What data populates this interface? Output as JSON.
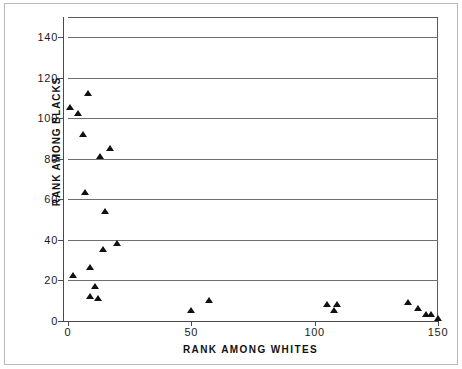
{
  "chart_data": {
    "type": "scatter",
    "title": "",
    "xlabel": "RANK AMONG WHITES",
    "ylabel": "RANK AMONG BLACKS",
    "xlim": [
      0,
      150
    ],
    "ylim": [
      0,
      150
    ],
    "xticks": [
      0,
      50,
      100,
      150
    ],
    "yticks": [
      0,
      20,
      40,
      60,
      80,
      100,
      120,
      140
    ],
    "xtick_labels": [
      "0",
      "50",
      "100",
      "150"
    ],
    "ytick_labels": [
      "0",
      "20",
      "40",
      "60",
      "80",
      "100",
      "120",
      "140"
    ],
    "grid": "horizontal",
    "legend": null,
    "marker": "triangle",
    "marker_color": "#111111",
    "points": [
      {
        "x": 1,
        "y": 105
      },
      {
        "x": 4,
        "y": 102
      },
      {
        "x": 8,
        "y": 112
      },
      {
        "x": 6,
        "y": 92
      },
      {
        "x": 13,
        "y": 81
      },
      {
        "x": 17,
        "y": 85
      },
      {
        "x": 7,
        "y": 63
      },
      {
        "x": 15,
        "y": 54
      },
      {
        "x": 14,
        "y": 35
      },
      {
        "x": 20,
        "y": 38
      },
      {
        "x": 2,
        "y": 22
      },
      {
        "x": 9,
        "y": 26
      },
      {
        "x": 11,
        "y": 17
      },
      {
        "x": 9,
        "y": 12
      },
      {
        "x": 12,
        "y": 11
      },
      {
        "x": 50,
        "y": 5
      },
      {
        "x": 57,
        "y": 10
      },
      {
        "x": 105,
        "y": 8
      },
      {
        "x": 109,
        "y": 8
      },
      {
        "x": 108,
        "y": 5
      },
      {
        "x": 138,
        "y": 9
      },
      {
        "x": 142,
        "y": 6
      },
      {
        "x": 145,
        "y": 3
      },
      {
        "x": 147,
        "y": 3
      },
      {
        "x": 150,
        "y": 1
      }
    ]
  },
  "axes": {
    "y_title": "RANK AMONG BLACKS",
    "x_title": "RANK AMONG WHITES"
  }
}
